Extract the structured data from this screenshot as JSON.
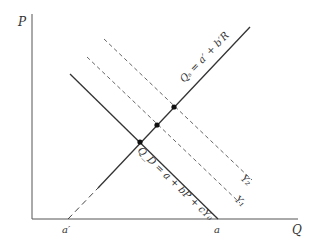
{
  "diagram": {
    "type": "supply-demand",
    "axes": {
      "y_label": "P",
      "x_label": "Q"
    },
    "intercepts": {
      "supply_x_intercept": "a′",
      "demand_x_intercept": "a"
    },
    "curves": {
      "supply": {
        "label": "Q_S = a′ + b′R",
        "label_display": "Qₛ = a′ + b′R",
        "style": "solid (dashed near axis)"
      },
      "demand": {
        "label": "Q_D = a + bP + cY₀",
        "style": "solid"
      },
      "demand_shift_1": {
        "label": "Y₁",
        "style": "dashed"
      },
      "demand_shift_2": {
        "label": "Y₂",
        "style": "dashed"
      }
    },
    "equilibrium_points": 3,
    "colors": {
      "line": "#333333",
      "background": "#ffffff"
    }
  }
}
